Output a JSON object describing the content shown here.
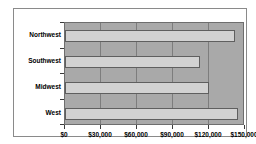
{
  "chart": {
    "background": "#ffffff",
    "frame_border_color": "#8a8a8a",
    "plot_background": "#a9a9a9",
    "gridline_color": "#7d7d7d",
    "bar_fill_color": "#d2d2d2",
    "bar_border_color": "#5f5f5f",
    "text_color": "#000000"
  },
  "chart_data": {
    "type": "bar",
    "orientation": "horizontal",
    "title": "",
    "xlabel": "",
    "ylabel": "",
    "categories": [
      "Northwest",
      "Southwest",
      "Midwest",
      "West"
    ],
    "values": [
      143000,
      114000,
      121000,
      146000
    ],
    "xlim": [
      0,
      150000
    ],
    "xticks": [
      0,
      30000,
      60000,
      90000,
      120000,
      150000
    ],
    "xtick_labels": [
      "$0",
      "$30,000",
      "$60,000",
      "$90,000",
      "$120,000",
      "$150,000"
    ],
    "grid": "vertical gridlines on",
    "legend": "none"
  }
}
